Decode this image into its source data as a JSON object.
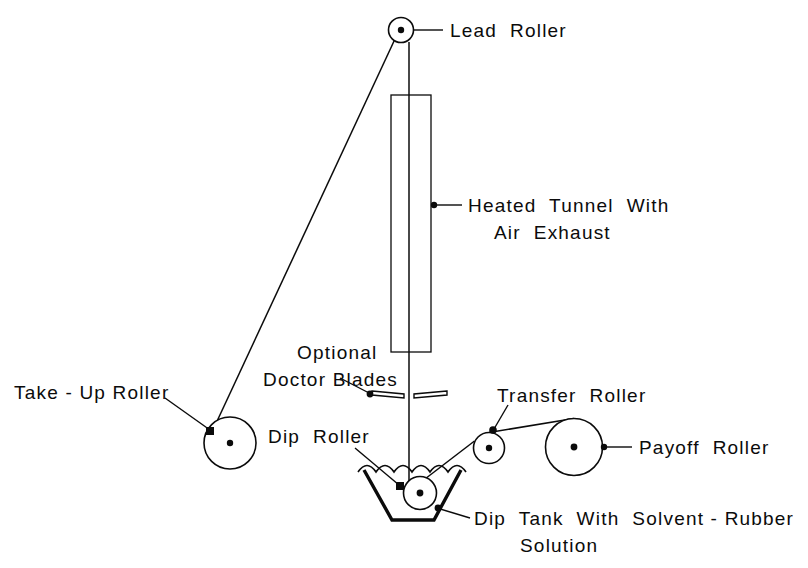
{
  "diagram": {
    "background_color": "#ffffff",
    "ink_color": "#0b0b0b",
    "labels": {
      "lead_roller": "Lead  Roller",
      "heated_tunnel_line1": "Heated  Tunnel  With",
      "heated_tunnel_line2": "Air  Exhaust",
      "optional_line1": "Optional",
      "optional_line2": "Doctor Blades",
      "take_up_roller": "Take - Up Roller",
      "dip_roller": "Dip  Roller",
      "transfer_roller": "Transfer  Roller",
      "payoff_roller": "Payoff  Roller",
      "dip_tank_line1": "Dip  Tank  With  Solvent - Rubber",
      "dip_tank_line2": "Solution"
    },
    "components": [
      {
        "name": "lead-roller",
        "type": "roller",
        "cx": 401,
        "cy": 30,
        "r": 12.5,
        "hub_r": 3.2
      },
      {
        "name": "take-up-roller",
        "type": "roller",
        "cx": 230,
        "cy": 443,
        "r": 26,
        "hub_r": 3.2
      },
      {
        "name": "dip-roller",
        "type": "roller",
        "cx": 420,
        "cy": 493,
        "r": 16.5,
        "hub_r": 3.4
      },
      {
        "name": "transfer-roller",
        "type": "roller",
        "cx": 489,
        "cy": 448,
        "r": 15.5,
        "hub_r": 3.2
      },
      {
        "name": "payoff-roller",
        "type": "roller",
        "cx": 574,
        "cy": 447,
        "r": 28.5,
        "hub_r": 3.4
      },
      {
        "name": "heated-tunnel",
        "type": "rect",
        "x": 391,
        "y": 95,
        "width": 40,
        "height": 257
      },
      {
        "name": "dip-tank",
        "type": "trapezoid",
        "top_left_x": 364,
        "top_right_x": 461,
        "top_y": 470,
        "bottom_left_x": 392,
        "bottom_right_x": 434,
        "bottom_y": 520
      },
      {
        "name": "liquid-surface",
        "type": "wave",
        "x_start": 358,
        "x_end": 466,
        "y": 470,
        "scallops": 6
      },
      {
        "name": "doctor-blade-left",
        "type": "blade",
        "y": 395
      },
      {
        "name": "doctor-blade-right",
        "type": "blade",
        "y": 395
      },
      {
        "name": "web-path",
        "type": "polyline"
      }
    ]
  }
}
